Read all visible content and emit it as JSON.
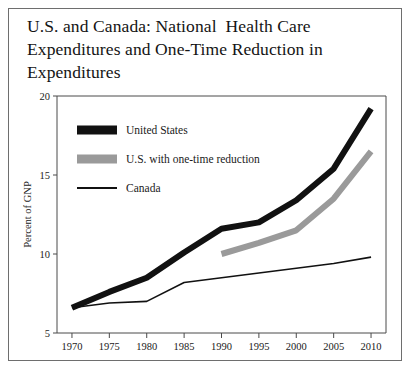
{
  "figure": {
    "title": "U.S. and Canada: National  Health Care\nExpenditures and One-Time Reduction in\nExpenditures"
  },
  "chart_data": {
    "type": "line",
    "title": "U.S. and Canada: National  Health Care Expenditures and One-Time Reduction in Expenditures",
    "xlabel": "",
    "ylabel": "Percent of GNP",
    "x": [
      1970,
      1975,
      1980,
      1985,
      1990,
      1995,
      2000,
      2005,
      2010
    ],
    "xlim": [
      1968,
      2012
    ],
    "ylim": [
      5,
      20
    ],
    "xticks": [
      "1970",
      "1975",
      "1980",
      "1985",
      "1990",
      "1995",
      "2000",
      "2005",
      "2010"
    ],
    "yticks": [
      "5",
      "10",
      "15",
      "20"
    ],
    "grid": false,
    "legend_position": "upper-left",
    "series": [
      {
        "name": "United States",
        "color": "#111111",
        "width": 6,
        "x": [
          1970,
          1975,
          1980,
          1985,
          1990,
          1995,
          2000,
          2005,
          2010
        ],
        "values": [
          6.6,
          7.6,
          8.5,
          10.1,
          11.6,
          12.0,
          13.4,
          15.4,
          19.2
        ]
      },
      {
        "name": "U.S. with one-time reduction",
        "color": "#9a9a9a",
        "width": 6,
        "x": [
          1990,
          1995,
          2000,
          2005,
          2010
        ],
        "values": [
          10.0,
          10.7,
          11.5,
          13.5,
          16.5
        ]
      },
      {
        "name": "Canada",
        "color": "#111111",
        "width": 1.6,
        "x": [
          1970,
          1975,
          1980,
          1985,
          1990,
          1995,
          2000,
          2005,
          2010
        ],
        "values": [
          6.6,
          6.9,
          7.0,
          8.2,
          8.5,
          8.8,
          9.1,
          9.4,
          9.8
        ]
      }
    ]
  },
  "legend": {
    "items": [
      {
        "label": "United States",
        "color": "#111111",
        "style": "thick-bar"
      },
      {
        "label": "U.S. with one-time reduction",
        "color": "#9a9a9a",
        "style": "thick-bar"
      },
      {
        "label": "Canada",
        "color": "#111111",
        "style": "thin-line"
      }
    ]
  }
}
